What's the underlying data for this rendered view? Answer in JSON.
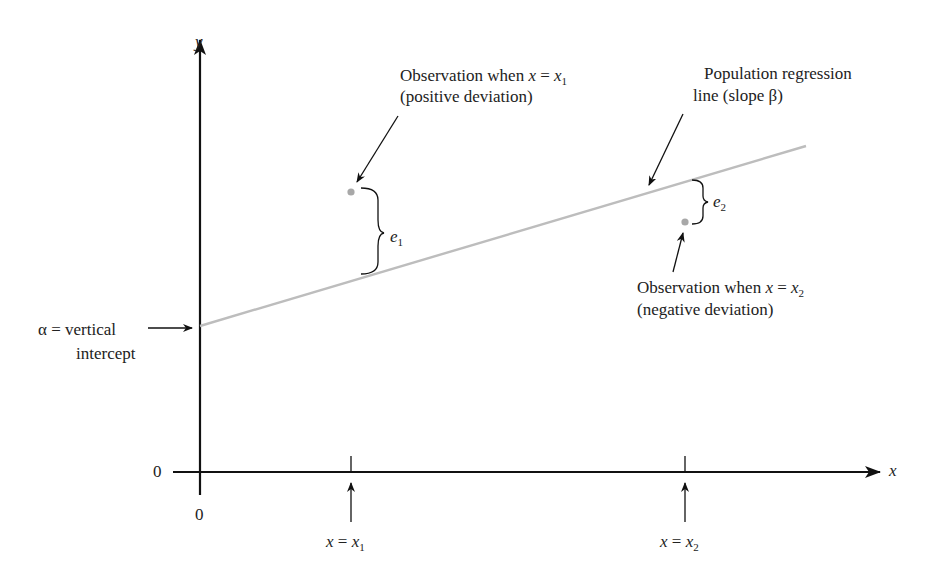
{
  "diagram": {
    "type": "regression-line-schematic",
    "axes": {
      "y_label": "y",
      "x_label": "x",
      "origin_y_label": "0",
      "origin_x_label": "0"
    },
    "regression_line": {
      "label_line1": "Population regression",
      "label_line2": "line (slope β)",
      "color": "#bdbdbd"
    },
    "intercept": {
      "label_line1": "α = vertical",
      "label_line2": "intercept"
    },
    "observation1": {
      "label_line1_prefix": "Observation when ",
      "label_var": "x",
      "label_eq": " = ",
      "label_val": "x",
      "label_sub": "1",
      "label_line2": "(positive deviation)",
      "error_label": "e",
      "error_sub": "1",
      "point_color": "#a8a8a8"
    },
    "observation2": {
      "label_line1_prefix": "Observation when ",
      "label_var": "x",
      "label_eq": " = ",
      "label_val": "x",
      "label_sub": "2",
      "label_line2": "(negative deviation)",
      "error_label": "e",
      "error_sub": "2",
      "point_color": "#a8a8a8"
    },
    "x_ticks": [
      {
        "var": "x",
        "eq": " = ",
        "val": "x",
        "sub": "1"
      },
      {
        "var": "x",
        "eq": " = ",
        "val": "x",
        "sub": "2"
      }
    ]
  }
}
